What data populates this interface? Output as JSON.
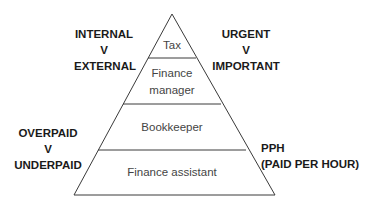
{
  "pyramid": {
    "tiers": [
      {
        "label": "Tax"
      },
      {
        "label_line1": "Finance",
        "label_line2": "manager"
      },
      {
        "label": "Bookkeeper"
      },
      {
        "label": "Finance assistant"
      }
    ]
  },
  "side_labels": {
    "top_left": {
      "line1": "INTERNAL",
      "line2": "V",
      "line3": "EXTERNAL"
    },
    "top_right": {
      "line1": "URGENT",
      "line2": "V",
      "line3": "IMPORTANT"
    },
    "bottom_left": {
      "line1": "OVERPAID",
      "line2": "V",
      "line3": "UNDERPAID"
    },
    "bottom_right": {
      "line1": "PPH",
      "line2": "(PAID PER HOUR)"
    }
  },
  "colors": {
    "line": "#3a3a3a",
    "tier_text": "#444444",
    "side_text": "#1a1a1a"
  }
}
